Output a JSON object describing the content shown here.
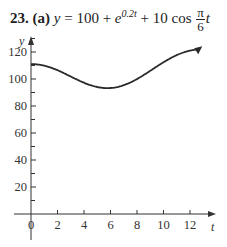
{
  "header": {
    "problem_number": "23.",
    "part": "(a)",
    "lhs": "y",
    "equals": "=",
    "term1": "100 +",
    "exp_base": "e",
    "exp_power": "0.2t",
    "term3": "+ 10 cos",
    "frac_num": "π",
    "frac_den": "6",
    "frac_var": "t"
  },
  "chart_data": {
    "type": "line",
    "xlabel": "t",
    "ylabel": "y",
    "xlim": [
      -1,
      13.5
    ],
    "ylim": [
      0,
      140
    ],
    "x_ticks": [
      0,
      2,
      4,
      6,
      8,
      10,
      12
    ],
    "x_tick_labels": [
      "0",
      "2",
      "4",
      "6",
      "8",
      "10",
      "12"
    ],
    "y_ticks": [
      20,
      40,
      60,
      80,
      100,
      120
    ],
    "y_tick_labels": [
      "20",
      "40",
      "60",
      "80",
      "100",
      "120"
    ],
    "y_minor_ticks": [
      10,
      30,
      50,
      70,
      90,
      110,
      130
    ],
    "grid": false,
    "legend": null,
    "series": [
      {
        "name": "y(t)",
        "x": [
          0,
          1,
          2,
          3,
          4,
          5,
          6,
          7,
          8,
          9,
          10,
          11,
          12,
          12.7
        ],
        "values": [
          111.0,
          109.9,
          106.5,
          101.8,
          97.2,
          94.0,
          93.3,
          95.4,
          100.0,
          106.0,
          112.4,
          117.7,
          121.0,
          122.5
        ]
      }
    ],
    "annotations": [
      "arrowhead at end of curve indicating continuation"
    ]
  }
}
